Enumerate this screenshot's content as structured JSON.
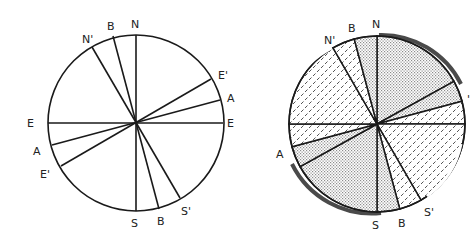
{
  "figure": {
    "panels": [
      {
        "id": "left",
        "description": "Unshaded circle divided by diameters",
        "center": [
          136,
          123
        ],
        "radius": 88,
        "lines": [
          {
            "name": "N-S",
            "from": [
              136,
              35
            ],
            "to": [
              136,
              211
            ]
          },
          {
            "name": "E-E",
            "from": [
              48,
              123
            ],
            "to": [
              223,
              123
            ]
          },
          {
            "name": "B-B",
            "from": [
              113,
              36
            ],
            "to": [
              159,
              209
            ]
          },
          {
            "name": "N'-S'",
            "from": [
              92,
              47
            ],
            "to": [
              180,
              198
            ]
          },
          {
            "name": "E'-E'",
            "from": [
              211,
              79
            ],
            "to": [
              61,
              166
            ]
          },
          {
            "name": "A-A",
            "from": [
              220,
              100
            ],
            "to": [
              52,
              145
            ]
          }
        ],
        "labels": [
          {
            "text": "N",
            "x": 131,
            "y": 28
          },
          {
            "text": "B",
            "x": 107,
            "y": 30
          },
          {
            "text": "N'",
            "x": 82,
            "y": 43
          },
          {
            "text": "E'",
            "x": 218,
            "y": 79
          },
          {
            "text": "A",
            "x": 227,
            "y": 102
          },
          {
            "text": "E",
            "x": 227,
            "y": 127
          },
          {
            "text": "E",
            "x": 27,
            "y": 127
          },
          {
            "text": "A",
            "x": 33,
            "y": 155
          },
          {
            "text": "E'",
            "x": 40,
            "y": 178
          },
          {
            "text": "S",
            "x": 131,
            "y": 227
          },
          {
            "text": "B",
            "x": 157,
            "y": 225
          },
          {
            "text": "S'",
            "x": 181,
            "y": 215
          }
        ]
      },
      {
        "id": "right",
        "description": "Shaded circle: stippled and hatched sectors, with dark shadow crescents",
        "center": [
          377,
          124
        ],
        "radius": 88,
        "sectors": [
          {
            "from_deg": -90,
            "to_deg": -29,
            "fill": "dots"
          },
          {
            "from_deg": -29,
            "to_deg": -15,
            "fill": "dots"
          },
          {
            "from_deg": -15,
            "to_deg": 0,
            "fill": "hatch"
          },
          {
            "from_deg": 0,
            "to_deg": 60,
            "fill": "hatch"
          },
          {
            "from_deg": 60,
            "to_deg": 75,
            "fill": "hatch"
          },
          {
            "from_deg": 75,
            "to_deg": 90,
            "fill": "dots"
          },
          {
            "from_deg": 90,
            "to_deg": 151,
            "fill": "dots"
          },
          {
            "from_deg": 151,
            "to_deg": 165,
            "fill": "dots"
          },
          {
            "from_deg": 165,
            "to_deg": 180,
            "fill": "hatch"
          },
          {
            "from_deg": 180,
            "to_deg": 240,
            "fill": "hatch"
          },
          {
            "from_deg": 240,
            "to_deg": 255,
            "fill": "hatch"
          },
          {
            "from_deg": 255,
            "to_deg": 270,
            "fill": "dots"
          }
        ],
        "labels": [
          {
            "text": "N",
            "x": 372,
            "y": 28
          },
          {
            "text": "B",
            "x": 348,
            "y": 32
          },
          {
            "text": "N'",
            "x": 324,
            "y": 44
          },
          {
            "text": "A",
            "x": 276,
            "y": 158
          },
          {
            "text": "S",
            "x": 372,
            "y": 229
          },
          {
            "text": "B",
            "x": 398,
            "y": 227
          },
          {
            "text": "S'",
            "x": 424,
            "y": 216
          },
          {
            "text": "'",
            "x": 467,
            "y": 103
          }
        ]
      }
    ],
    "colors": {
      "line": "#1a1a1a",
      "dots": "#9a9a9a",
      "hatch": "#3a3a3a",
      "shadow": "#4a4a4a",
      "background": "#ffffff"
    }
  }
}
